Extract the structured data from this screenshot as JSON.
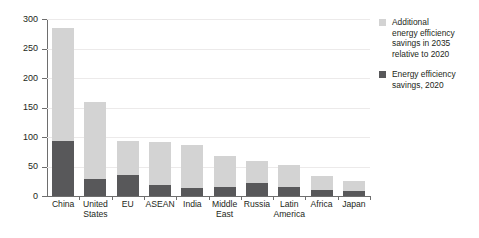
{
  "chart_data": {
    "type": "bar",
    "subtype": "stacked-vertical",
    "title": "",
    "xlabel": "",
    "ylabel": "Mtoe",
    "ylim": [
      0,
      300
    ],
    "yticks": [
      0,
      50,
      100,
      150,
      200,
      250,
      300
    ],
    "ytick_labels": [
      "0",
      "50",
      "100",
      "150",
      "200",
      "250",
      "300"
    ],
    "grid": "horizontal",
    "legend_position": "right",
    "categories": [
      "China",
      "United States",
      "EU",
      "ASEAN",
      "India",
      "Middle East",
      "Russia",
      "Latin America",
      "Africa",
      "Japan"
    ],
    "category_lines": [
      [
        "China"
      ],
      [
        "United",
        "States"
      ],
      [
        "EU"
      ],
      [
        "ASEAN"
      ],
      [
        "India"
      ],
      [
        "Middle",
        "East"
      ],
      [
        "Russia"
      ],
      [
        "Latin",
        "America"
      ],
      [
        "Africa"
      ],
      [
        "Japan"
      ]
    ],
    "series": [
      {
        "name": "Energy efficiency savings, 2020",
        "color": "#58585a",
        "values": [
          93,
          28,
          35,
          19,
          14,
          15,
          22,
          16,
          11,
          9
        ]
      },
      {
        "name": "Additional energy efficiency savings in 2035 relative to 2020",
        "color": "#d3d3d3",
        "values": [
          192,
          131,
          58,
          72,
          73,
          52,
          37,
          37,
          23,
          17
        ]
      }
    ],
    "totals": [
      285,
      159,
      93,
      91,
      87,
      67,
      59,
      53,
      34,
      26
    ]
  },
  "legend": {
    "entries": [
      {
        "swatch": "#d3d3d3",
        "lines": [
          "Additional",
          "energy efficiency",
          "savings in 2035",
          "relative to 2020"
        ]
      },
      {
        "swatch": "#58585a",
        "lines": [
          "Energy efficiency",
          "savings, 2020"
        ]
      }
    ]
  },
  "colors": {
    "axis": "#6e6e6e",
    "grid": "#eceaea",
    "text": "#231f20",
    "background": "#ffffff"
  }
}
